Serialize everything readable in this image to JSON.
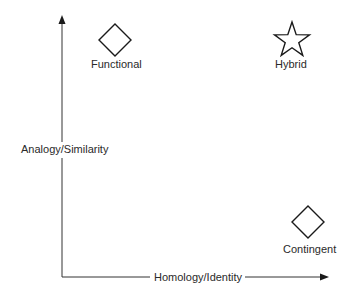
{
  "diagram": {
    "axes": {
      "y_label": "Analogy/Similarity",
      "x_label": "Homology/Identity"
    },
    "nodes": [
      {
        "id": "functional",
        "label": "Functional",
        "shape": "diamond",
        "quadrant": "top-left"
      },
      {
        "id": "hybrid",
        "label": "Hybrid",
        "shape": "star",
        "quadrant": "top-right"
      },
      {
        "id": "contingent",
        "label": "Contingent",
        "shape": "diamond",
        "quadrant": "bottom-right"
      }
    ],
    "colors": {
      "stroke": "#1a1a1a",
      "axis": "#333333",
      "background": "#ffffff"
    }
  }
}
